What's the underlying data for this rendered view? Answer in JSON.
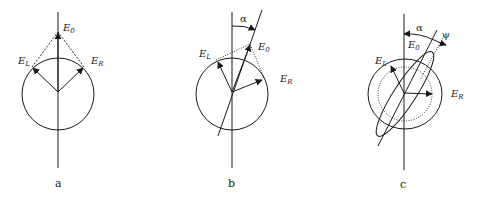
{
  "figure": {
    "panels": [
      {
        "id": "a",
        "caption": "a",
        "labels": {
          "e0": "E",
          "e0_sub": "0",
          "el": "E",
          "el_sub": "L",
          "er": "E",
          "er_sub": "R"
        }
      },
      {
        "id": "b",
        "caption": "b",
        "labels": {
          "alpha": "α",
          "e0": "E",
          "e0_sub": "0",
          "el": "E",
          "el_sub": "L",
          "er": "E",
          "er_sub": "R"
        }
      },
      {
        "id": "c",
        "caption": "c",
        "labels": {
          "alpha": "α",
          "psi": "ψ",
          "e0": "E",
          "e0_sub": "0",
          "el": "E",
          "el_sub": "L",
          "er": "E",
          "er_sub": "R"
        }
      }
    ],
    "colors": {
      "ink": "#1a1a1a",
      "background": "#ffffff"
    }
  }
}
